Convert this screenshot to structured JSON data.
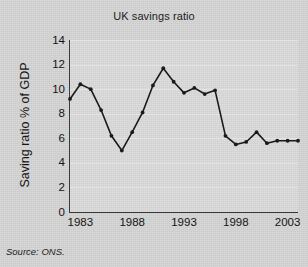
{
  "chart_data": {
    "type": "line",
    "title": "UK savings ratio",
    "xlabel": "",
    "ylabel": "Saving ratio % of GDP",
    "source": "Source: ONS.",
    "grid": true,
    "legend": "none",
    "marker": "filled-circle",
    "line_color": "#1a1a1a",
    "xlim": [
      1982,
      2004
    ],
    "ylim": [
      0,
      14
    ],
    "ytick_labels": [
      "0",
      "2",
      "4",
      "6",
      "8",
      "10",
      "12",
      "14"
    ],
    "yticks": [
      0,
      2,
      4,
      6,
      8,
      10,
      12,
      14
    ],
    "xtick_labels": [
      "1983",
      "1988",
      "1993",
      "1998",
      "2003"
    ],
    "xticks": [
      1983,
      1988,
      1993,
      1998,
      2003
    ],
    "x": [
      1982,
      1983,
      1984,
      1985,
      1986,
      1987,
      1988,
      1989,
      1990,
      1991,
      1992,
      1993,
      1994,
      1995,
      1996,
      1997,
      1998,
      1999,
      2000,
      2001,
      2002,
      2003,
      2004
    ],
    "values": [
      9.2,
      10.4,
      10.0,
      8.3,
      6.2,
      5.0,
      6.5,
      8.1,
      10.3,
      11.7,
      10.6,
      9.7,
      10.1,
      9.6,
      9.9,
      6.2,
      5.5,
      5.7,
      6.5,
      5.6,
      5.8,
      5.8,
      5.8
    ],
    "series": [
      {
        "name": "UK savings ratio",
        "values": [
          9.2,
          10.4,
          10.0,
          8.3,
          6.2,
          5.0,
          6.5,
          8.1,
          10.3,
          11.7,
          10.6,
          9.7,
          10.1,
          9.6,
          9.9,
          6.2,
          5.5,
          5.7,
          6.5,
          5.6,
          5.8,
          5.8,
          5.8
        ]
      }
    ]
  }
}
